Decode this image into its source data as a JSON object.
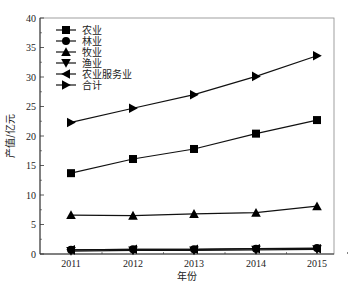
{
  "chart_data": {
    "type": "line",
    "title": "",
    "xlabel": "年份",
    "ylabel": "产值/亿元",
    "x": [
      "2011",
      "2012",
      "2013",
      "2014",
      "2015"
    ],
    "ylim": [
      0,
      40
    ],
    "yticks": [
      0,
      5,
      10,
      15,
      20,
      25,
      30,
      35,
      40
    ],
    "grid": false,
    "legend_position": "upper-left",
    "series": [
      {
        "name": "农业",
        "marker": "square",
        "values": [
          13.7,
          16.1,
          17.8,
          20.4,
          22.7
        ]
      },
      {
        "name": "林业",
        "marker": "circle",
        "values": [
          0.7,
          0.8,
          0.8,
          0.9,
          1.0
        ]
      },
      {
        "name": "牧业",
        "marker": "triangle-up",
        "values": [
          6.6,
          6.5,
          6.8,
          7.0,
          8.1
        ]
      },
      {
        "name": "渔业",
        "marker": "triangle-down",
        "values": [
          0.5,
          0.6,
          0.6,
          0.7,
          0.8
        ]
      },
      {
        "name": "农业服务业",
        "marker": "triangle-left",
        "values": [
          0.7,
          0.8,
          0.8,
          0.9,
          0.9
        ]
      },
      {
        "name": "合计",
        "marker": "triangle-right",
        "values": [
          22.3,
          24.7,
          27.0,
          30.1,
          33.6
        ]
      }
    ]
  }
}
